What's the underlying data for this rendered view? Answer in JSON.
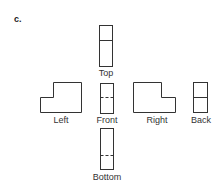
{
  "figure": {
    "label": "c.",
    "views": {
      "top": "Top",
      "left": "Left",
      "front": "Front",
      "right": "Right",
      "back": "Back",
      "bottom": "Bottom"
    },
    "stroke_color": "#333333"
  }
}
